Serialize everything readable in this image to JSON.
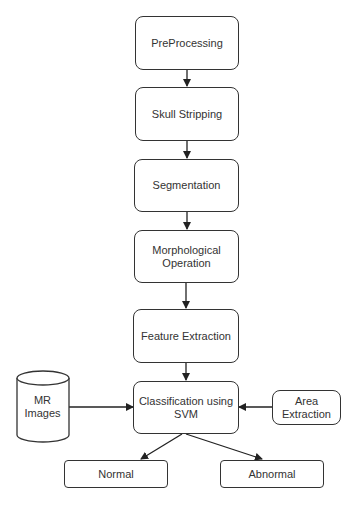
{
  "diagram": {
    "type": "flowchart",
    "nodes": {
      "preprocessing": "PreProcessing",
      "skull_stripping": "Skull Stripping",
      "segmentation": "Segmentation",
      "morphological_1": "Morphological",
      "morphological_2": "Operation",
      "feature_extraction": "Feature Extraction",
      "classification_1": "Classification using",
      "classification_2": "SVM",
      "mr_images_1": "MR",
      "mr_images_2": "Images",
      "area_extraction_1": "Area",
      "area_extraction_2": "Extraction",
      "normal": "Normal",
      "abnormal": "Abnormal"
    },
    "edges": [
      {
        "from": "PreProcessing",
        "to": "Skull Stripping"
      },
      {
        "from": "Skull Stripping",
        "to": "Segmentation"
      },
      {
        "from": "Segmentation",
        "to": "Morphological Operation"
      },
      {
        "from": "Morphological Operation",
        "to": "Feature Extraction"
      },
      {
        "from": "Feature Extraction",
        "to": "Classification using SVM"
      },
      {
        "from": "MR Images",
        "to": "Classification using SVM"
      },
      {
        "from": "Area Extraction",
        "to": "Classification using SVM"
      },
      {
        "from": "Classification using SVM",
        "to": "Normal"
      },
      {
        "from": "Classification using SVM",
        "to": "Abnormal"
      }
    ]
  }
}
